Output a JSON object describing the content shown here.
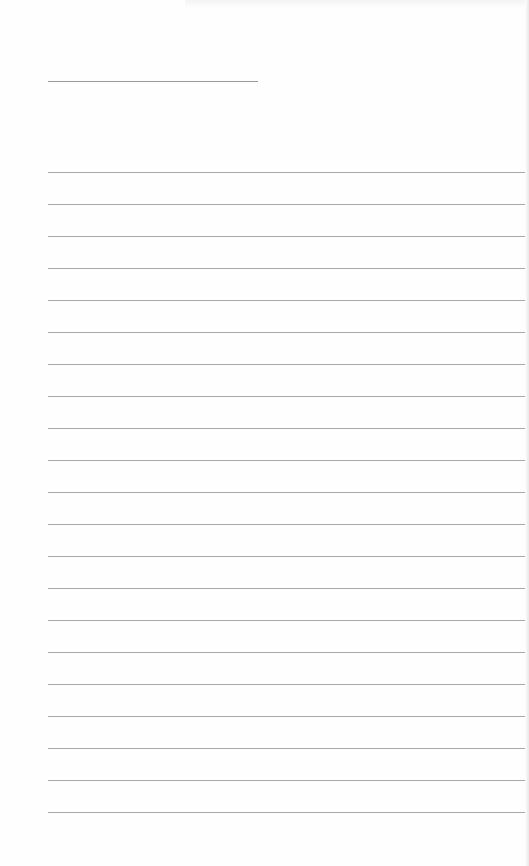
{
  "document": {
    "type": "lined-notepad-page",
    "title_line": {
      "x": 48,
      "y": 81,
      "width": 210
    },
    "rules": {
      "count": 21,
      "first_y": 172,
      "spacing": 32,
      "x": 48,
      "width": 477
    },
    "colors": {
      "paper": "#fefefe",
      "rule": "#a8a8a8",
      "title_line": "#9a9a9a"
    }
  }
}
